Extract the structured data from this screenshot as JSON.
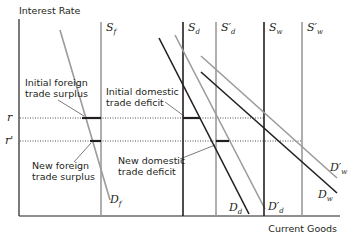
{
  "diagram": {
    "y_axis_label": "Interest Rate",
    "x_axis_label": "Current Goods",
    "rate_levels": [
      {
        "label": "r",
        "y": 118
      },
      {
        "label": "r'",
        "y": 141
      }
    ],
    "curves": {
      "S_f": {
        "base": "S",
        "sub": "f",
        "color": "#9b9b9b"
      },
      "D_f": {
        "base": "D",
        "sub": "f",
        "color": "#9b9b9b"
      },
      "S_d": {
        "base": "S",
        "sub": "d",
        "color": "#231f20"
      },
      "S_d_prime": {
        "base": "S′",
        "sub": "d",
        "color": "#9b9b9b"
      },
      "D_d": {
        "base": "D",
        "sub": "d",
        "color": "#231f20"
      },
      "D_d_prime": {
        "base": "D′",
        "sub": "d",
        "color": "#9b9b9b"
      },
      "S_w": {
        "base": "S",
        "sub": "w",
        "color": "#231f20"
      },
      "S_w_prime": {
        "base": "S′",
        "sub": "w",
        "color": "#9b9b9b"
      },
      "D_w": {
        "base": "D",
        "sub": "w",
        "color": "#231f20"
      },
      "D_w_prime": {
        "base": "D′",
        "sub": "w",
        "color": "#9b9b9b"
      }
    },
    "annotations": {
      "initial_foreign": [
        "Initial foreign",
        "trade surplus"
      ],
      "new_foreign": [
        "New foreign",
        "trade surplus"
      ],
      "initial_domestic": [
        "Initial domestic",
        "trade deficit"
      ],
      "new_domestic": [
        "New domestic",
        "trade deficit"
      ]
    },
    "colors": {
      "black": "#231f20",
      "gray": "#9b9b9b"
    }
  }
}
